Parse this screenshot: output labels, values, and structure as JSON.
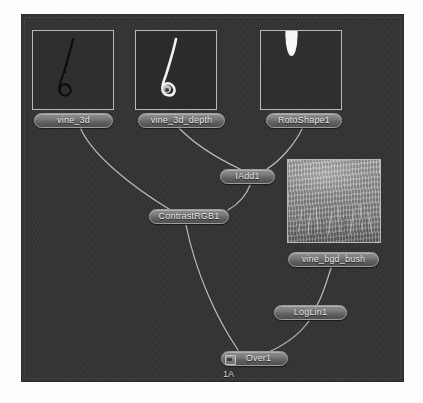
{
  "app": {
    "kind": "node-graph-editor",
    "canvas_bg": "#343434",
    "node_fill": "#7a7a7a",
    "wire_color": "#c9c9c9"
  },
  "thumbnails": [
    {
      "id": "thumb-vine-3d",
      "alt": "dark curled vine on black",
      "style": "vine_dark"
    },
    {
      "id": "thumb-vine-3d-depth",
      "alt": "bright curled vine on black",
      "style": "vine_bright"
    },
    {
      "id": "thumb-rotoshape",
      "alt": "white rounded roto shape at top",
      "style": "roto"
    },
    {
      "id": "thumb-vine-bgd-bush",
      "alt": "grey bush foliage plate",
      "style": "bush"
    }
  ],
  "nodes": [
    {
      "id": "vine_3d",
      "label": "vine_3d",
      "viewer": false
    },
    {
      "id": "vine_3d_depth",
      "label": "vine_3d_depth",
      "viewer": false
    },
    {
      "id": "RotoShape1",
      "label": "RotoShape1",
      "viewer": false
    },
    {
      "id": "IAdd1",
      "label": "IAdd1",
      "viewer": false
    },
    {
      "id": "ContrastRGB1",
      "label": "ContrastRGB1",
      "viewer": false
    },
    {
      "id": "vine_bgd_bush",
      "label": "vine_bgd_bush",
      "viewer": false
    },
    {
      "id": "LogLin1",
      "label": "LogLin1",
      "viewer": false
    },
    {
      "id": "Over1",
      "label": "Over1",
      "viewer": true
    }
  ],
  "labels": {
    "viewer_badge": "1A"
  },
  "connections": [
    {
      "from": "vine_3d",
      "to": "ContrastRGB1"
    },
    {
      "from": "vine_3d_depth",
      "to": "IAdd1"
    },
    {
      "from": "RotoShape1",
      "to": "IAdd1"
    },
    {
      "from": "IAdd1",
      "to": "ContrastRGB1"
    },
    {
      "from": "ContrastRGB1",
      "to": "Over1"
    },
    {
      "from": "vine_bgd_bush",
      "to": "LogLin1"
    },
    {
      "from": "LogLin1",
      "to": "Over1"
    }
  ]
}
